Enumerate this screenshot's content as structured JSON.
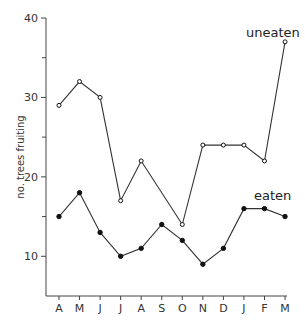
{
  "chart_data": {
    "type": "line",
    "title": "",
    "xlabel": "",
    "ylabel": "no. trees fruiting",
    "categories": [
      "A",
      "M",
      "J",
      "J",
      "A",
      "S",
      "O",
      "N",
      "D",
      "J",
      "F",
      "M"
    ],
    "series": [
      {
        "name": "uneaten",
        "marker": "open-circle",
        "values": [
          29,
          32,
          30,
          17,
          22,
          null,
          14,
          24,
          24,
          24,
          22,
          37
        ]
      },
      {
        "name": "eaten",
        "marker": "filled-circle",
        "values": [
          15,
          18,
          13,
          10,
          11,
          14,
          12,
          9,
          11,
          16,
          16,
          15
        ]
      }
    ],
    "ylim": [
      5,
      40
    ],
    "yticks_labeled": [
      10,
      20,
      30,
      40
    ],
    "yticks_minor": [
      15,
      25,
      35
    ],
    "grid": false,
    "legend": "inline labels"
  }
}
